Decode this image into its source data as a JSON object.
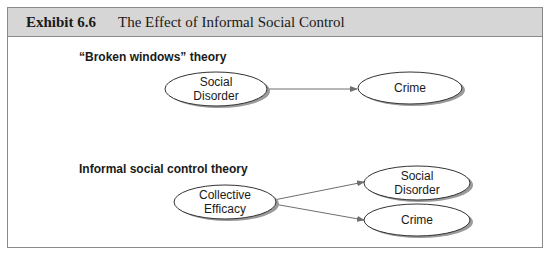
{
  "exhibit": {
    "number": "Exhibit 6.6",
    "title": "The Effect of Informal Social Control"
  },
  "diagrams": {
    "broken_windows": {
      "label": "“Broken windows” theory",
      "nodes": {
        "social_disorder": {
          "line1": "Social",
          "line2": "Disorder"
        },
        "crime": {
          "line1": "Crime"
        }
      },
      "edges": [
        {
          "from": "Social Disorder",
          "to": "Crime"
        }
      ]
    },
    "informal_control": {
      "label": "Informal social control theory",
      "nodes": {
        "collective_efficacy": {
          "line1": "Collective",
          "line2": "Efficacy"
        },
        "social_disorder": {
          "line1": "Social",
          "line2": "Disorder"
        },
        "crime": {
          "line1": "Crime"
        }
      },
      "edges": [
        {
          "from": "Collective Efficacy",
          "to": "Social Disorder"
        },
        {
          "from": "Collective Efficacy",
          "to": "Crime"
        }
      ]
    }
  },
  "colors": {
    "header_bg": "#d6d6d6",
    "border": "#8a8a8a",
    "arrow": "#6f6f6f",
    "ellipse_stroke": "#333333",
    "ellipse_shadow": "#9a9a9a"
  }
}
